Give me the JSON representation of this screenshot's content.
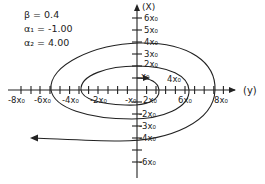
{
  "parameters": [
    {
      "symbol": "β",
      "value": "0.4",
      "text": "β = 0.4"
    },
    {
      "symbol": "α₁",
      "value": "-1.00",
      "text": "α₁ = -1.00"
    },
    {
      "symbol": "α₂",
      "value": "4.00",
      "text": "α₂ = 4.00"
    }
  ],
  "axes": {
    "horizontal_label": "(y)",
    "vertical_label": "(X)",
    "horizontal_ticks": [
      "-8x₀",
      "-6x₀",
      "-4x₀",
      "-2x₀",
      "-x₀",
      "2x₀",
      "6x₀",
      "8x₀"
    ],
    "vertical_ticks": [
      "6x₀",
      "5x₀",
      "4x₀",
      "3x₀",
      "2x₀",
      "x₀",
      "-2x₀",
      "-3x₀",
      "-4x₀",
      "-6x₀"
    ],
    "curve_labels": [
      "x₀",
      "4x₀"
    ]
  },
  "colors": {
    "ink": "#222222",
    "background": "#ffffff"
  }
}
